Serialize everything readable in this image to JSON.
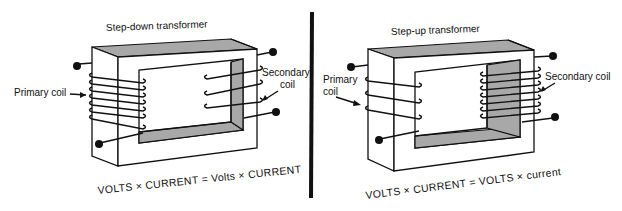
{
  "figure": {
    "left_panel": {
      "title": "Step-down transformer",
      "primary_label": "Primary coil",
      "secondary_label_line1": "Secondary",
      "secondary_label_line2": "coil",
      "primary_turns": 7,
      "secondary_turns": 3,
      "equation": "VOLTS × CURRENT = Volts × CURRENT"
    },
    "right_panel": {
      "title": "Step-up transformer",
      "primary_label_line1": "Primary",
      "primary_label_line2": "coil",
      "secondary_label": "Secondary coil",
      "primary_turns": 3,
      "secondary_turns": 7,
      "equation": "VOLTS × CURRENT = VOLTS × current"
    },
    "colors": {
      "ink": "#111111",
      "core_shade": "#a8a8a8",
      "background": "#ffffff"
    }
  }
}
